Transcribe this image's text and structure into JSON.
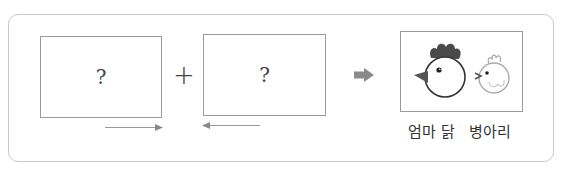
{
  "diagram": {
    "boxes": [
      {
        "id": "box-1",
        "content": "?"
      },
      {
        "id": "box-2",
        "content": "?"
      },
      {
        "id": "box-3",
        "content": "mother-hen-and-chick-illustration"
      }
    ],
    "operator": "+",
    "result_arrow": "right-arrow-icon",
    "arrows_below": [
      {
        "under": "box-1",
        "direction": "right"
      },
      {
        "under": "box-2",
        "direction": "left"
      }
    ],
    "result_label": "엄마 닭   병아리",
    "result_labels": [
      "엄마 닭",
      "병아리"
    ],
    "colors": {
      "frame_border": "#c9c9c9",
      "box_border": "#9a9a9a",
      "arrow": "#8a8a8a",
      "hen_comb": "#4a4a4a",
      "chick_outline": "#aaaaaa"
    }
  }
}
